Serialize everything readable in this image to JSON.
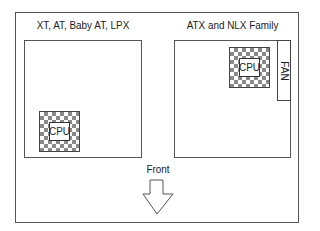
{
  "diagram": {
    "left_panel": {
      "title": "XT, AT, Baby AT, LPX",
      "cpu_label": "CPU"
    },
    "right_panel": {
      "title": "ATX and NLX Family",
      "cpu_label": "CPU",
      "fan_label": "FAN"
    },
    "front": {
      "label": "Front",
      "arrow_direction": "down"
    },
    "colors": {
      "outline": "#555555",
      "checker_dark": "#8a8a8a",
      "background": "#ffffff"
    }
  }
}
